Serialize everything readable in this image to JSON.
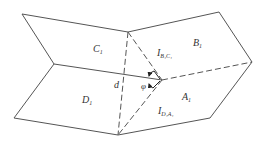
{
  "diagram": {
    "type": "folded-planes-dihedral",
    "colors": {
      "line": "#555555",
      "text": "#333333",
      "background": "#ffffff"
    },
    "regions": [
      {
        "id": "C1",
        "main": "C",
        "sub": "1"
      },
      {
        "id": "B1",
        "main": "B",
        "sub": "1"
      },
      {
        "id": "D1",
        "main": "D",
        "sub": "1"
      },
      {
        "id": "A1",
        "main": "A",
        "sub": "1"
      }
    ],
    "labels": {
      "c1": {
        "main": "C",
        "sub": "1"
      },
      "b1": {
        "main": "B",
        "sub": "1"
      },
      "d1": {
        "main": "D",
        "sub": "1"
      },
      "a1": {
        "main": "A",
        "sub": "1"
      },
      "ibc": {
        "main": "I",
        "sub": "B₁C₁"
      },
      "ida": {
        "main": "I",
        "sub": "D₁A₁"
      },
      "d": "d",
      "phi": "φ"
    }
  }
}
